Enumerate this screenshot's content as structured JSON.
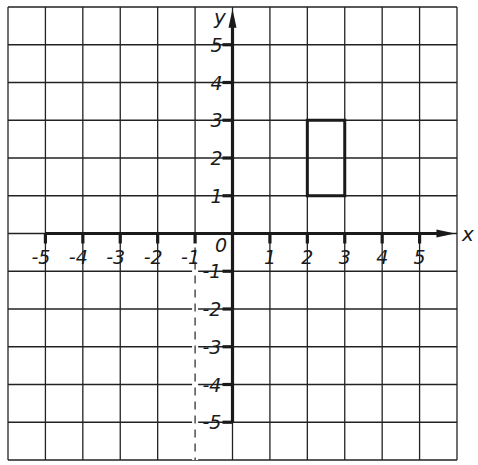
{
  "diagram": {
    "type": "coordinate-grid",
    "grid": {
      "columns": 12,
      "rows": 12,
      "x_range": [
        -6,
        6
      ],
      "y_range": [
        -6,
        6
      ],
      "line_color": "#222222",
      "background": "#ffffff"
    },
    "axes": {
      "x_label": "x",
      "y_label": "y",
      "origin_label": "0",
      "x_ticks": [
        "-5",
        "-4",
        "-3",
        "-2",
        "-1",
        "1",
        "2",
        "3",
        "4",
        "5"
      ],
      "x_tick_values": [
        -5,
        -4,
        -3,
        -2,
        -1,
        1,
        2,
        3,
        4,
        5
      ],
      "y_ticks": [
        "5",
        "4",
        "3",
        "2",
        "1",
        "-1",
        "-2",
        "-3",
        "-4",
        "-5"
      ],
      "y_tick_values": [
        5,
        4,
        3,
        2,
        1,
        -1,
        -2,
        -3,
        -4,
        -5
      ]
    },
    "shapes": [
      {
        "name": "rectangle",
        "vertices": [
          [
            2,
            1
          ],
          [
            3,
            1
          ],
          [
            3,
            3
          ],
          [
            2,
            3
          ]
        ],
        "stroke": "#1a1a1a"
      }
    ],
    "dashed_lines": [
      {
        "name": "mirror-line",
        "x": -1,
        "from_y": 0,
        "to_y": -6
      }
    ]
  }
}
